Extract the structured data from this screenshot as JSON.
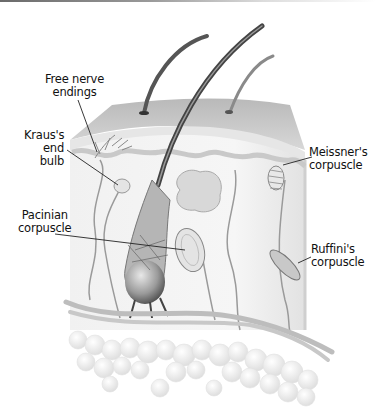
{
  "figure": {
    "labels": {
      "free_nerve": {
        "line1": "Free nerve",
        "line2": "endings"
      },
      "kraus": {
        "line1": "Kraus's",
        "line2": "end",
        "line3": "bulb"
      },
      "pacinian": {
        "line1": "Pacinian",
        "line2": "corpuscle"
      },
      "meissner": {
        "line1": "Meissner's",
        "line2": "corpuscle"
      },
      "ruffini": {
        "line1": "Ruffini's",
        "line2": "corpuscle"
      }
    }
  }
}
